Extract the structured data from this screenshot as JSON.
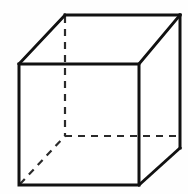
{
  "figure": {
    "type": "line-drawing",
    "canvas": {
      "width": 188,
      "height": 194,
      "background_color": "#fefefe"
    },
    "style": {
      "visible_edge_color": "#111111",
      "visible_edge_width": 3,
      "hidden_edge_color": "#2a2a2a",
      "hidden_edge_width": 2.2,
      "hidden_edge_dash": "7 6",
      "face_fill_color": "#ffffff"
    },
    "vertices": {
      "front_top_left": [
        19,
        64
      ],
      "front_top_right": [
        139,
        64
      ],
      "front_bottom_right": [
        139,
        185
      ],
      "front_bottom_left": [
        19,
        185
      ],
      "back_top_left": [
        65,
        15
      ],
      "back_top_right": [
        180,
        15
      ],
      "back_bottom_right": [
        180,
        148
      ],
      "back_bottom_left": [
        65,
        136
      ]
    },
    "edges": [
      {
        "name": "front-top",
        "from": "front_top_left",
        "to": "front_top_right",
        "hidden": false
      },
      {
        "name": "front-right",
        "from": "front_top_right",
        "to": "front_bottom_right",
        "hidden": false
      },
      {
        "name": "front-bottom",
        "from": "front_bottom_right",
        "to": "front_bottom_left",
        "hidden": false
      },
      {
        "name": "front-left",
        "from": "front_bottom_left",
        "to": "front_top_left",
        "hidden": false
      },
      {
        "name": "back-top",
        "from": "back_top_left",
        "to": "back_top_right",
        "hidden": false
      },
      {
        "name": "back-right",
        "from": "back_top_right",
        "to": "back_bottom_right",
        "hidden": false
      },
      {
        "name": "top-left-diagonal",
        "from": "front_top_left",
        "to": "back_top_left",
        "hidden": false
      },
      {
        "name": "top-right-diagonal",
        "from": "front_top_right",
        "to": "back_top_right",
        "hidden": false
      },
      {
        "name": "bottom-right-diagonal",
        "from": "front_bottom_right",
        "to": "back_bottom_right",
        "hidden": false
      },
      {
        "name": "back-left-vertical",
        "from": "back_top_left",
        "to": "back_bottom_left",
        "hidden": true
      },
      {
        "name": "back-bottom",
        "from": "back_bottom_left",
        "to": "back_bottom_right",
        "hidden": true
      },
      {
        "name": "bottom-left-diagonal",
        "from": "front_bottom_left",
        "to": "back_bottom_left",
        "hidden": true
      }
    ],
    "paths": {
      "face_top": "M 19 64 L 65 15 L 180 15 L 139 64 Z",
      "face_front": "M 19 64 L 139 64 L 139 185 L 19 185 Z",
      "face_right": "M 139 64 L 180 15 L 180 148 L 139 185 Z",
      "front_rect": "M 19 64 L 139 64 L 139 185 L 19 185 Z",
      "back_top_edge": "M 65 15 L 180 15",
      "back_right_edge": "M 180 15 L 180 148",
      "diag_top_left": "M 19 64 L 65 15",
      "diag_top_right": "M 139 64 L 180 15",
      "diag_bottom_right": "M 139 185 L 180 148",
      "hidden_vertical": "M 65 16 L 65 136",
      "hidden_horizontal": "M 65 136 L 179 136",
      "hidden_diagonal": "M 20 184 L 65 136"
    }
  }
}
